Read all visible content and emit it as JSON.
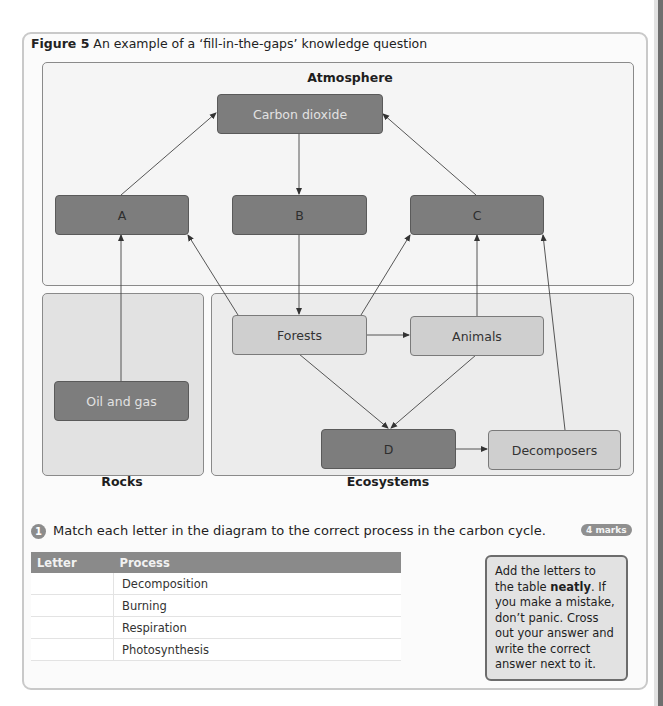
{
  "figure": {
    "label": "Figure 5",
    "caption": "An example of a ‘fill-in-the-gaps’ knowledge question"
  },
  "diagram": {
    "panels": {
      "atmosphere": "Atmosphere",
      "rocks": "Rocks",
      "ecosystems": "Ecosystems"
    },
    "nodes": {
      "carbon_dioxide": "Carbon dioxide",
      "a": "A",
      "b": "B",
      "c": "C",
      "oil_and_gas": "Oil and gas",
      "forests": "Forests",
      "animals": "Animals",
      "d": "D",
      "decomposers": "Decomposers"
    },
    "arrows": [
      {
        "from": "A",
        "to": "Carbon dioxide"
      },
      {
        "from": "Carbon dioxide",
        "to": "B"
      },
      {
        "from": "C",
        "to": "Carbon dioxide"
      },
      {
        "from": "Oil and gas",
        "to": "A"
      },
      {
        "from": "Forests",
        "to": "A"
      },
      {
        "from": "B",
        "to": "Forests"
      },
      {
        "from": "Forests",
        "to": "C"
      },
      {
        "from": "Animals",
        "to": "C"
      },
      {
        "from": "Decomposers",
        "to": "C"
      },
      {
        "from": "Forests",
        "to": "Animals"
      },
      {
        "from": "Forests",
        "to": "D"
      },
      {
        "from": "Animals",
        "to": "D"
      },
      {
        "from": "D",
        "to": "Decomposers"
      }
    ],
    "colors": {
      "dark_node": "#7d7d7d",
      "light_node": "#cfcfcf",
      "panel_border": "#8a8a8a"
    }
  },
  "question": {
    "number": "1",
    "text": "Match each letter in the diagram to the correct process in the carbon cycle.",
    "marks": "4 marks"
  },
  "table": {
    "headers": [
      "Letter",
      "Process"
    ],
    "rows": [
      {
        "letter": "",
        "process": "Decomposition"
      },
      {
        "letter": "",
        "process": "Burning"
      },
      {
        "letter": "",
        "process": "Respiration"
      },
      {
        "letter": "",
        "process": "Photosynthesis"
      }
    ]
  },
  "tip": {
    "before": "Add the letters to the table ",
    "bold": "neatly",
    "after": ". If you make a mistake, don’t panic. Cross out your answer and write the correct answer next to it."
  }
}
